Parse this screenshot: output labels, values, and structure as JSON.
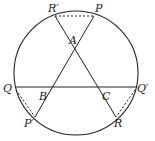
{
  "diagram": {
    "type": "geometry-circle-chords",
    "circle": {
      "cx": 76,
      "cy": 73,
      "r": 62
    },
    "points": {
      "R_prime": {
        "label": "R′",
        "x": 55,
        "y": 16
      },
      "P": {
        "label": "P",
        "x": 94,
        "y": 16
      },
      "A": {
        "label": "A",
        "x": 75,
        "y": 49
      },
      "Q": {
        "label": "Q",
        "x": 15,
        "y": 87
      },
      "Q_prime": {
        "label": "Q′",
        "x": 136,
        "y": 87
      },
      "B": {
        "label": "B",
        "x": 53,
        "y": 87
      },
      "C": {
        "label": "C",
        "x": 98,
        "y": 87
      },
      "P_prime": {
        "label": "P′",
        "x": 35,
        "y": 117
      },
      "R": {
        "label": "R",
        "x": 116,
        "y": 117
      }
    },
    "solid_segments": [
      [
        "Q",
        "Q_prime"
      ],
      [
        "P",
        "P_prime"
      ],
      [
        "R_prime",
        "R"
      ]
    ],
    "dashed_segments": [
      [
        "R_prime",
        "P"
      ],
      [
        "Q",
        "P_prime"
      ],
      [
        "Q_prime",
        "R"
      ]
    ],
    "colors": {
      "stroke": "#222222",
      "background": "#ffffff"
    }
  }
}
